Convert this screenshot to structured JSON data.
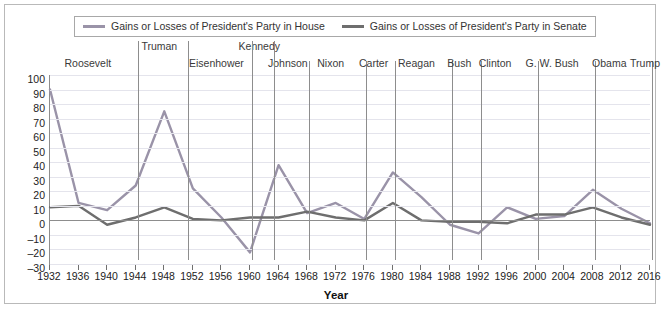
{
  "legend": {
    "entries": [
      {
        "label": "Gains or Losses of President's Party in House",
        "color": "#9a93a8",
        "icon": "line-swatch"
      },
      {
        "label": "Gains or Losses of President's Party in Senate",
        "color": "#6e6e6e",
        "icon": "line-swatch"
      }
    ]
  },
  "axis": {
    "x_title": "Year"
  },
  "presidents": [
    {
      "name": "Roosevelt",
      "center_year": 1938,
      "row": 1
    },
    {
      "name": "Truman",
      "center_year": 1948,
      "row": 0
    },
    {
      "name": "Eisenhower",
      "center_year": 1956,
      "row": 1
    },
    {
      "name": "Kennedy",
      "center_year": 1962,
      "row": 0
    },
    {
      "name": "Johnson",
      "center_year": 1966,
      "row": 1
    },
    {
      "name": "Nixon",
      "center_year": 1972,
      "row": 1
    },
    {
      "name": "Carter",
      "center_year": 1978,
      "row": 1
    },
    {
      "name": "Reagan",
      "center_year": 1984,
      "row": 1
    },
    {
      "name": "Bush",
      "center_year": 1990,
      "row": 1
    },
    {
      "name": "Clinton",
      "center_year": 1995,
      "row": 1
    },
    {
      "name": "G. W. Bush",
      "center_year": 2003,
      "row": 1
    },
    {
      "name": "Obama",
      "center_year": 2011,
      "row": 1
    },
    {
      "name": "Trump",
      "center_year": 2016,
      "row": 1
    }
  ],
  "president_dividers": [
    1945,
    1952,
    1961,
    1964,
    1969,
    1977,
    1981,
    1989,
    1993,
    2001,
    2009,
    2017
  ],
  "chart_data": {
    "type": "line",
    "title": "",
    "xlabel": "Year",
    "ylabel": "",
    "xlim": [
      1932,
      2016
    ],
    "ylim": [
      -30,
      100
    ],
    "ytick_step": 10,
    "grid": true,
    "legend_position": "top",
    "x": [
      1932,
      1936,
      1940,
      1944,
      1948,
      1952,
      1956,
      1960,
      1964,
      1968,
      1972,
      1976,
      1980,
      1984,
      1988,
      1992,
      1996,
      2000,
      2004,
      2008,
      2012,
      2016
    ],
    "yticks": [
      100,
      90,
      80,
      70,
      60,
      50,
      40,
      30,
      20,
      10,
      0,
      -10,
      -20,
      -30
    ],
    "xticks": [
      1932,
      1936,
      1940,
      1944,
      1948,
      1952,
      1956,
      1960,
      1964,
      1968,
      1972,
      1976,
      1980,
      1984,
      1988,
      1992,
      1996,
      2000,
      2004,
      2008,
      2012,
      2016
    ],
    "series": [
      {
        "name": "Gains or Losses of President's Party in House",
        "color": "#9a93a8",
        "values": [
          90,
          12,
          7,
          24,
          75,
          22,
          2,
          -22,
          38,
          5,
          12,
          1,
          33,
          16,
          -3,
          -9,
          9,
          1,
          3,
          21,
          8,
          -2
        ]
      },
      {
        "name": "Gains or Losses of President's Party in Senate",
        "color": "#6e6e6e",
        "values": [
          9,
          10,
          -3,
          2,
          9,
          1,
          0,
          2,
          2,
          6,
          2,
          0,
          12,
          0,
          -1,
          -1,
          -2,
          4,
          4,
          9,
          2,
          -3
        ]
      }
    ]
  }
}
